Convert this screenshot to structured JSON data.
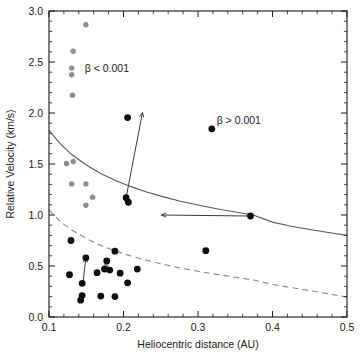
{
  "chart_data": {
    "type": "scatter",
    "title": "",
    "xlabel": "Heliocentric distance (AU)",
    "ylabel": "Relative Velocity (km/s)",
    "xlim": [
      0.1,
      0.5
    ],
    "ylim": [
      0.0,
      3.0
    ],
    "xticks": [
      0.1,
      0.2,
      0.3,
      0.4,
      0.5
    ],
    "xtick_labels": [
      "0.1",
      "0.2",
      "0.3",
      "0.4",
      "0.5"
    ],
    "yticks": [
      0.0,
      0.5,
      1.0,
      1.5,
      2.0,
      2.5,
      3.0
    ],
    "ytick_labels": [
      "0.0",
      "0.5",
      "1.0",
      "1.5",
      "2.0",
      "2.5",
      "3.0"
    ],
    "grid": false,
    "legend_position": "none",
    "annotations": [
      {
        "text": "β < 0.001",
        "x": 0.148,
        "y": 2.44,
        "name": "beta-less-than-label"
      },
      {
        "text": "β > 0.001",
        "x": 0.325,
        "y": 1.93,
        "name": "beta-greater-than-label"
      }
    ],
    "series": [
      {
        "name": "beta < 0.001",
        "marker": "circle",
        "color": "#8e8e8e",
        "radius": 2.7,
        "points": [
          [
            0.1495,
            2.865
          ],
          [
            0.1325,
            2.605
          ],
          [
            0.1305,
            2.44
          ],
          [
            0.1305,
            2.375
          ],
          [
            0.1315,
            2.175
          ],
          [
            0.1235,
            1.505
          ],
          [
            0.1325,
            1.525
          ],
          [
            0.1305,
            1.305
          ],
          [
            0.1495,
            1.305
          ],
          [
            0.1585,
            1.175
          ],
          [
            0.1495,
            1.095
          ],
          [
            0.1765,
            0.495
          ],
          [
            0.3105,
            0.65
          ]
        ]
      },
      {
        "name": "beta > 0.001",
        "marker": "circle",
        "color": "#0d0d0d",
        "radius": 3.4,
        "points": [
          [
            0.2055,
            1.955
          ],
          [
            0.3185,
            1.845
          ],
          [
            0.2065,
            1.125
          ],
          [
            0.2035,
            1.17
          ],
          [
            0.3705,
            0.99
          ],
          [
            0.3105,
            0.65
          ],
          [
            0.1295,
            0.75
          ],
          [
            0.1495,
            0.58
          ],
          [
            0.1885,
            0.645
          ],
          [
            0.1775,
            0.55
          ],
          [
            0.1275,
            0.415
          ],
          [
            0.1645,
            0.435
          ],
          [
            0.1745,
            0.47
          ],
          [
            0.1815,
            0.46
          ],
          [
            0.1955,
            0.43
          ],
          [
            0.2185,
            0.47
          ],
          [
            0.2055,
            0.335
          ],
          [
            0.1445,
            0.33
          ],
          [
            0.1445,
            0.21
          ],
          [
            0.1425,
            0.165
          ],
          [
            0.1695,
            0.205
          ],
          [
            0.1885,
            0.2
          ]
        ]
      }
    ],
    "curves": [
      {
        "name": "upper-escape-curve",
        "style": "solid",
        "color": "#5a5a5a",
        "points": [
          [
            0.1,
            1.83
          ],
          [
            0.115,
            1.7
          ],
          [
            0.13,
            1.595
          ],
          [
            0.15,
            1.49
          ],
          [
            0.17,
            1.405
          ],
          [
            0.19,
            1.335
          ],
          [
            0.21,
            1.278
          ],
          [
            0.23,
            1.228
          ],
          [
            0.25,
            1.185
          ],
          [
            0.275,
            1.138
          ],
          [
            0.3,
            1.098
          ],
          [
            0.325,
            1.062
          ],
          [
            0.35,
            1.03
          ],
          [
            0.375,
            0.998
          ],
          [
            0.4,
            0.93
          ],
          [
            0.425,
            0.89
          ],
          [
            0.45,
            0.858
          ],
          [
            0.475,
            0.828
          ],
          [
            0.5,
            0.8
          ]
        ]
      },
      {
        "name": "lower-escape-curve",
        "style": "dashed",
        "color": "#8a8a8a",
        "points": [
          [
            0.1,
            1.05
          ],
          [
            0.115,
            0.935
          ],
          [
            0.13,
            0.855
          ],
          [
            0.15,
            0.77
          ],
          [
            0.17,
            0.7
          ],
          [
            0.19,
            0.645
          ],
          [
            0.21,
            0.598
          ],
          [
            0.23,
            0.558
          ],
          [
            0.25,
            0.522
          ],
          [
            0.275,
            0.482
          ],
          [
            0.3,
            0.448
          ],
          [
            0.325,
            0.418
          ],
          [
            0.35,
            0.39
          ],
          [
            0.375,
            0.362
          ],
          [
            0.4,
            0.32
          ],
          [
            0.425,
            0.288
          ],
          [
            0.45,
            0.258
          ],
          [
            0.475,
            0.228
          ],
          [
            0.5,
            0.195
          ]
        ]
      }
    ],
    "arrows": [
      {
        "name": "arrow-up-right",
        "x1": 0.2035,
        "y1": 1.17,
        "x2": 0.2255,
        "y2": 2.005
      },
      {
        "name": "arrow-left",
        "x1": 0.3705,
        "y1": 0.99,
        "x2": 0.251,
        "y2": 1.0
      },
      {
        "name": "arrow-up-short",
        "x1": 0.1455,
        "y1": 0.33,
        "x2": 0.1495,
        "y2": 0.58
      }
    ]
  }
}
